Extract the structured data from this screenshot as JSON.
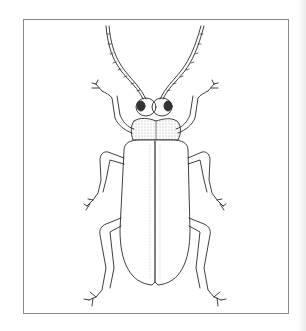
{
  "image": {
    "subject": "Beetle line illustration (dorsal view)",
    "style": "pen-and-ink stipple drawing",
    "frame_color": "#8a8a8a",
    "ink_color": "#2a2a2a",
    "background": "#ffffff"
  }
}
